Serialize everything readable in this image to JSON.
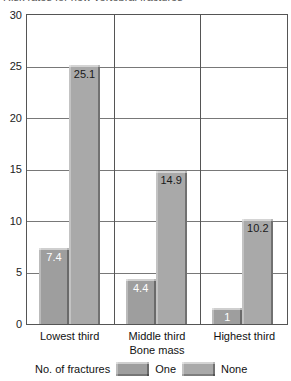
{
  "title": "Risk rates for new vertebral fractures",
  "chart_data": {
    "type": "bar",
    "title": "Risk rates for new vertebral fractures",
    "categories": [
      "Lowest third",
      "Middle third",
      "Highest third"
    ],
    "series": [
      {
        "name": "One",
        "values": [
          7.4,
          4.4,
          1
        ],
        "labels": [
          "7.4",
          "4.4",
          "1"
        ],
        "color": "#9e9e9e",
        "label_color": "#ffffff"
      },
      {
        "name": "None",
        "values": [
          25.1,
          14.9,
          10.2
        ],
        "labels": [
          "25.1",
          "14.9",
          "10.2"
        ],
        "color": "#a9a9a9",
        "label_color": "#1a1a1a"
      }
    ],
    "xlabel": "Bone mass",
    "ylabel": "",
    "ylim": [
      0,
      30
    ],
    "yticks": [
      0,
      5,
      10,
      15,
      20,
      25,
      30
    ],
    "grid": true,
    "legend_position": "bottom",
    "legend_title": "No. of fractures"
  },
  "legend": {
    "title": "No. of fractures",
    "items": [
      {
        "label": "One"
      },
      {
        "label": "None"
      }
    ]
  },
  "colors": {
    "axis_line": "#555555",
    "gridline": "#787878",
    "bar_one": "#9e9e9e",
    "bar_none": "#a9a9a9"
  }
}
